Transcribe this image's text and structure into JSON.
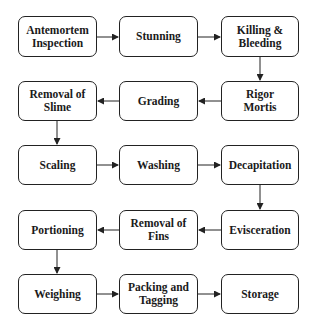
{
  "diagram": {
    "type": "flowchart",
    "steps": [
      {
        "id": "s1",
        "label": "Antemortem\nInspection"
      },
      {
        "id": "s2",
        "label": "Stunning"
      },
      {
        "id": "s3",
        "label": "Killing &\nBleeding"
      },
      {
        "id": "s4",
        "label": "Rigor\nMortis"
      },
      {
        "id": "s5",
        "label": "Grading"
      },
      {
        "id": "s6",
        "label": "Removal of\nSlime"
      },
      {
        "id": "s7",
        "label": "Scaling"
      },
      {
        "id": "s8",
        "label": "Washing"
      },
      {
        "id": "s9",
        "label": "Decapitation"
      },
      {
        "id": "s10",
        "label": "Evisceration"
      },
      {
        "id": "s11",
        "label": "Removal of\nFins"
      },
      {
        "id": "s12",
        "label": "Portioning"
      },
      {
        "id": "s13",
        "label": "Weighing"
      },
      {
        "id": "s14",
        "label": "Packing and\nTagging"
      },
      {
        "id": "s15",
        "label": "Storage"
      }
    ],
    "edges": [
      [
        "s1",
        "s2"
      ],
      [
        "s2",
        "s3"
      ],
      [
        "s3",
        "s4"
      ],
      [
        "s4",
        "s5"
      ],
      [
        "s5",
        "s6"
      ],
      [
        "s6",
        "s7"
      ],
      [
        "s7",
        "s8"
      ],
      [
        "s8",
        "s9"
      ],
      [
        "s9",
        "s10"
      ],
      [
        "s10",
        "s11"
      ],
      [
        "s11",
        "s12"
      ],
      [
        "s12",
        "s13"
      ],
      [
        "s13",
        "s14"
      ],
      [
        "s14",
        "s15"
      ]
    ]
  }
}
